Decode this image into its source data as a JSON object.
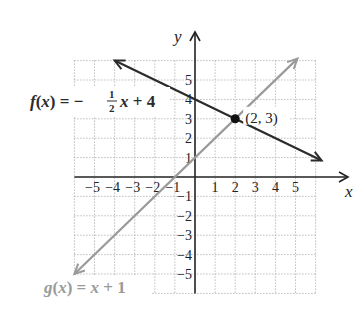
{
  "chart_data": {
    "type": "line",
    "title": "",
    "xlabel": "x",
    "ylabel": "y",
    "xlim": [
      -6,
      6
    ],
    "ylim": [
      -6,
      6
    ],
    "grid": true,
    "x_ticks": [
      -5,
      -4,
      -3,
      -2,
      -1,
      1,
      2,
      3,
      4,
      5
    ],
    "y_ticks": [
      -5,
      -4,
      -3,
      -2,
      -1,
      1,
      2,
      3,
      4,
      5
    ],
    "series": [
      {
        "name": "f(x) = -1/2 x + 4",
        "label_prefix": "f(x) = −",
        "label_frac_num": "1",
        "label_frac_den": "2",
        "label_suffix": "x + 4",
        "slope": -0.5,
        "intercept": 4,
        "x_range": [
          -4,
          6.3
        ],
        "color": "#2b2b2b"
      },
      {
        "name": "g(x) = x + 1",
        "label": "g(x) = x + 1",
        "slope": 1,
        "intercept": 1,
        "x_range": [
          -6,
          5.1
        ],
        "color": "#9a9a9a"
      }
    ],
    "annotations": [
      {
        "text": "(2, 3)",
        "x": 2,
        "y": 3,
        "type": "intersection-point"
      }
    ]
  }
}
